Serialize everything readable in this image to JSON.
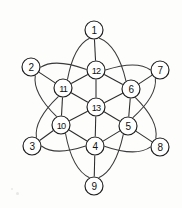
{
  "figure": {
    "background_color": "#fdfdfc",
    "stroke_color": "#2b2b2b",
    "node_fill_color": "#ffffff",
    "node_radius": 9,
    "width": 182,
    "height": 208
  },
  "nodes": [
    {
      "id": "1",
      "label": "1",
      "x": 94,
      "y": 30,
      "ring": "outer"
    },
    {
      "id": "2",
      "label": "2",
      "x": 31,
      "y": 67,
      "ring": "outer"
    },
    {
      "id": "3",
      "label": "3",
      "x": 32,
      "y": 146,
      "ring": "outer"
    },
    {
      "id": "4",
      "label": "4",
      "x": 95,
      "y": 146,
      "ring": "inner"
    },
    {
      "id": "5",
      "label": "5",
      "x": 128,
      "y": 126,
      "ring": "inner"
    },
    {
      "id": "6",
      "label": "6",
      "x": 131,
      "y": 89,
      "ring": "inner"
    },
    {
      "id": "7",
      "label": "7",
      "x": 160,
      "y": 70,
      "ring": "outer"
    },
    {
      "id": "8",
      "label": "8",
      "x": 160,
      "y": 147,
      "ring": "outer"
    },
    {
      "id": "9",
      "label": "9",
      "x": 94,
      "y": 186,
      "ring": "outer"
    },
    {
      "id": "10",
      "label": "10",
      "x": 61,
      "y": 125,
      "ring": "inner"
    },
    {
      "id": "11",
      "label": "11",
      "x": 63,
      "y": 88,
      "ring": "inner"
    },
    {
      "id": "12",
      "label": "12",
      "x": 96,
      "y": 70,
      "ring": "inner"
    },
    {
      "id": "13",
      "label": "13",
      "x": 96,
      "y": 107,
      "ring": "center"
    }
  ],
  "edges": [
    {
      "from": "1",
      "to": "12",
      "kind": "straight"
    },
    {
      "from": "2",
      "to": "11",
      "kind": "straight"
    },
    {
      "from": "3",
      "to": "10",
      "kind": "straight"
    },
    {
      "from": "7",
      "to": "6",
      "kind": "straight"
    },
    {
      "from": "8",
      "to": "5",
      "kind": "straight"
    },
    {
      "from": "9",
      "to": "4",
      "kind": "straight"
    },
    {
      "from": "12",
      "to": "11",
      "kind": "straight"
    },
    {
      "from": "11",
      "to": "10",
      "kind": "straight"
    },
    {
      "from": "10",
      "to": "4",
      "kind": "straight"
    },
    {
      "from": "4",
      "to": "5",
      "kind": "straight"
    },
    {
      "from": "5",
      "to": "6",
      "kind": "straight"
    },
    {
      "from": "6",
      "to": "12",
      "kind": "straight"
    },
    {
      "from": "13",
      "to": "12",
      "kind": "straight"
    },
    {
      "from": "13",
      "to": "11",
      "kind": "straight"
    },
    {
      "from": "13",
      "to": "10",
      "kind": "straight"
    },
    {
      "from": "13",
      "to": "4",
      "kind": "straight"
    },
    {
      "from": "13",
      "to": "5",
      "kind": "straight"
    },
    {
      "from": "13",
      "to": "6",
      "kind": "straight"
    },
    {
      "from": "2",
      "to": "12",
      "kind": "arc"
    },
    {
      "from": "12",
      "to": "7",
      "kind": "arc"
    },
    {
      "from": "7",
      "to": "5",
      "kind": "arc"
    },
    {
      "from": "5",
      "to": "9",
      "kind": "arc"
    },
    {
      "from": "9",
      "to": "10",
      "kind": "arc"
    },
    {
      "from": "10",
      "to": "2",
      "kind": "arc"
    },
    {
      "from": "1",
      "to": "11",
      "kind": "arc"
    },
    {
      "from": "1",
      "to": "6",
      "kind": "arc"
    },
    {
      "from": "3",
      "to": "11",
      "kind": "arc"
    },
    {
      "from": "3",
      "to": "4",
      "kind": "arc"
    },
    {
      "from": "8",
      "to": "6",
      "kind": "arc"
    },
    {
      "from": "8",
      "to": "4",
      "kind": "arc"
    }
  ],
  "counts": {
    "nodes": 13,
    "edges": 30
  }
}
